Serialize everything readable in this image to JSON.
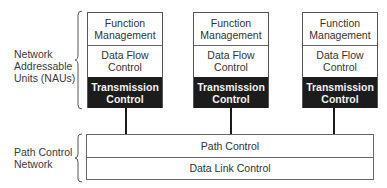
{
  "diagram": {
    "left_labels": {
      "nau": [
        "Network",
        "Addressable",
        "Units (NAUs)"
      ],
      "pcn": [
        "Path Control",
        "Network"
      ]
    },
    "nau_stacks": [
      {
        "function_management": [
          "Function",
          "Management"
        ],
        "data_flow_control": [
          "Data Flow",
          "Control"
        ],
        "transmission_control": [
          "Transmission",
          "Control"
        ]
      },
      {
        "function_management": [
          "Function",
          "Management"
        ],
        "data_flow_control": [
          "Data Flow",
          "Control"
        ],
        "transmission_control": [
          "Transmission",
          "Control"
        ]
      },
      {
        "function_management": [
          "Function",
          "Management"
        ],
        "data_flow_control": [
          "Data Flow",
          "Control"
        ],
        "transmission_control": [
          "Transmission",
          "Control"
        ]
      }
    ],
    "path_control_network": {
      "path_control": "Path Control",
      "data_link_control": "Data Link Control"
    },
    "colors": {
      "transmission_fill": "#1c1c1c",
      "transmission_text": "#f2f2f2",
      "border": "#555555"
    }
  }
}
